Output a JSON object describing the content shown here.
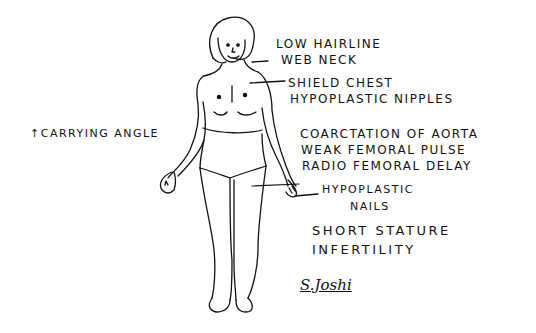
{
  "diagram": {
    "labels": {
      "low_hairline": "LOW HAIRLINE",
      "web_neck": "WEB NECK",
      "shield_chest": "SHIELD CHEST",
      "hypoplastic_nipples": "HYPOPLASTIC NIPPLES",
      "carrying_angle": "↑CARRYING ANGLE",
      "coarctation": "COARCTATION OF AORTA",
      "weak_femoral_pulse": "WEAK FEMORAL PULSE",
      "radio_femoral_delay": "RADIO FEMORAL DELAY",
      "hypoplastic": "HYPOPLASTIC",
      "nails": "NAILS",
      "short_stature": "SHORT STATURE",
      "infertility": "INFERTILITY"
    },
    "signature": "S.Joshi",
    "colors": {
      "ink": "#111111",
      "paper": "#ffffff"
    }
  }
}
